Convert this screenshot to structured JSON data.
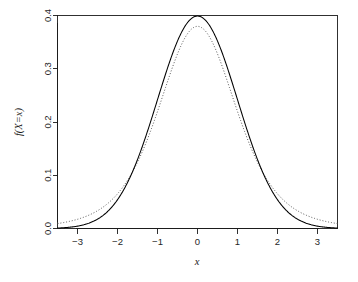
{
  "chart_data": {
    "type": "line",
    "title": "",
    "subtitle": "",
    "xlabel": "x",
    "ylabel": "f(X=x)",
    "xlim": [
      -3.5,
      3.5
    ],
    "ylim": [
      0.0,
      0.4
    ],
    "grid": false,
    "legend": "none",
    "xticks": [
      "-3",
      "-2",
      "-1",
      "0",
      "1",
      "2",
      "3"
    ],
    "xtick_values": [
      -3,
      -2,
      -1,
      0,
      1,
      2,
      3
    ],
    "yticks": [
      "0.0",
      "0.1",
      "0.2",
      "0.3",
      "0.4"
    ],
    "ytick_values": [
      0.0,
      0.1,
      0.2,
      0.3,
      0.4
    ],
    "x": [
      -3.5,
      -3.25,
      -3.0,
      -2.75,
      -2.5,
      -2.25,
      -2.0,
      -1.75,
      -1.5,
      -1.25,
      -1.0,
      -0.75,
      -0.5,
      -0.25,
      0.0,
      0.25,
      0.5,
      0.75,
      1.0,
      1.25,
      1.5,
      1.75,
      2.0,
      2.25,
      2.5,
      2.75,
      3.0,
      3.25,
      3.5
    ],
    "series": [
      {
        "name": "normal-density",
        "style": "solid",
        "color": "#000000",
        "peak": 0.3989,
        "values": [
          0.0009,
          0.002,
          0.0044,
          0.0091,
          0.0175,
          0.0317,
          0.054,
          0.0863,
          0.1295,
          0.1826,
          0.242,
          0.3011,
          0.3521,
          0.3867,
          0.3989,
          0.3867,
          0.3521,
          0.3011,
          0.242,
          0.1826,
          0.1295,
          0.0863,
          0.054,
          0.0317,
          0.0175,
          0.0091,
          0.0044,
          0.002,
          0.0009
        ]
      },
      {
        "name": "t-density",
        "style": "dotted",
        "color": "#555555",
        "peak": 0.3796,
        "values": [
          0.0094,
          0.0122,
          0.0159,
          0.0207,
          0.0271,
          0.0355,
          0.0465,
          0.0605,
          0.0783,
          0.1,
          0.1258,
          0.1552,
          0.1867,
          0.2177,
          0.2443,
          0.2177,
          0.1867,
          0.1552,
          0.1258,
          0.1,
          0.0783,
          0.0605,
          0.0465,
          0.0355,
          0.0271,
          0.0207,
          0.0159,
          0.0122,
          0.0094
        ]
      }
    ]
  },
  "figure": {
    "background_color": "#ffffff",
    "axis_color": "#1a1a1a"
  }
}
